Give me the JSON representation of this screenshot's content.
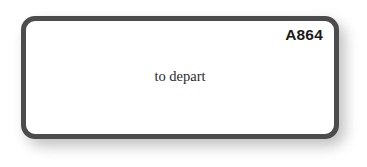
{
  "canvas": {
    "background_color": "#ffffff",
    "width": 367,
    "height": 167
  },
  "node": {
    "id_label": "A864",
    "body_text": "to depart",
    "shape": "rounded-rectangle",
    "fill_color": "#ffffff",
    "border_color": "#4c4c4c",
    "text_color": "#2b2b2b",
    "id_text_color": "#1b1b1b",
    "shadow_color": "#8d8d8d"
  }
}
